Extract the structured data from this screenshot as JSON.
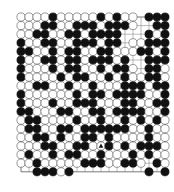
{
  "board": {
    "size": 19,
    "origin_x": 21,
    "origin_y": 17,
    "spacing_x": 8.0,
    "spacing_y": 8.6,
    "stone_radius": 4.1,
    "colors": {
      "black": "#111111",
      "white": "#ffffff",
      "line": "#777777",
      "stone_edge": "#555555"
    },
    "rows": [
      "WWWWBWWWWWBWBWW.BBB",
      "WWWBBWWBBBWBBBW..BB",
      "WWBBWWBBWBBBB...BWB",
      "BWWBBWWBBBWBB.WWBBB",
      "BBWWBWBBWWBBWWWBBWB",
      "BWWBBWBBWBBBWB..BBB",
      "BWWWBWBBWWBWBBW.BBW",
      "BWWWWBWBBWWBWBWWBBW",
      "WWBBWWBWWBWWWBBBWBB",
      "BWWWWWWBWBBWBBBBWWB",
      "BWWWBWWBBBWWWBBWWBB",
      "BBWWWBBWWBBWBBBBWWB",
      "WBBWWWWBWWBWWBWBWBW",
      "WBBWWBBWBBBBBBWWBWW",
      "WWBBWBWWBBWBWWWWBWW",
      "WWWBBWWBBWWBWBWBBBW",
      "WBWWBWBBWWBWWWBWBWW",
      "WWBWWWWWBBBWWBBW.BW",
      "..BBBWB.........B.B."
    ],
    "marker": {
      "type": "triangle",
      "row": 15,
      "col": 10
    }
  },
  "caption": "illegible"
}
